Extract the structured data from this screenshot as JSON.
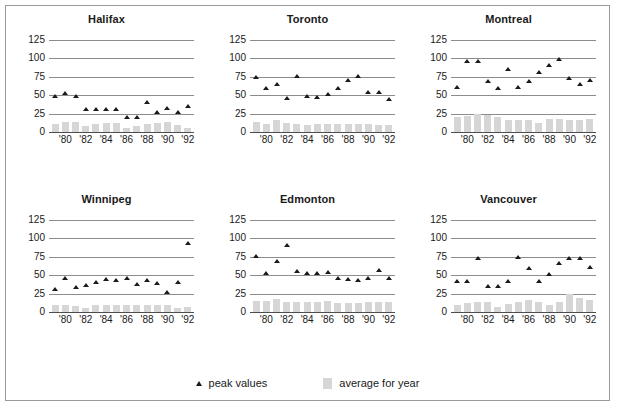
{
  "figure": {
    "border_color": "#9a9a9a",
    "background": "#ffffff"
  },
  "legend": {
    "peak_label": "peak values",
    "average_label": "average for year"
  },
  "axis": {
    "yticks": [
      0,
      25,
      50,
      75,
      100,
      125
    ],
    "ylim": [
      0,
      125
    ],
    "xtick_labels": [
      "'80",
      "'82",
      "'84",
      "'86",
      "'88",
      "'90",
      "'92"
    ],
    "xtick_years": [
      1980,
      1982,
      1984,
      1986,
      1988,
      1990,
      1992
    ],
    "xlim": [
      1978.4,
      1992.6
    ]
  },
  "colors": {
    "marker": "#1a1a1a",
    "bar": "#d6d6d6",
    "gridline": "#8c8c8c",
    "text": "#1a1a1a"
  },
  "chart_data": [
    {
      "type": "scatter",
      "title": "Halifax",
      "xlabel": "",
      "ylabel": "",
      "ylim": [
        0,
        125
      ],
      "grid": true,
      "legend_position": "bottom",
      "x": [
        1979,
        1980,
        1981,
        1982,
        1983,
        1984,
        1985,
        1986,
        1987,
        1988,
        1989,
        1990,
        1991,
        1992
      ],
      "series": [
        {
          "name": "peak values",
          "type": "scatter",
          "values": [
            48,
            52,
            48,
            31,
            31,
            31,
            31,
            20,
            20,
            40,
            26,
            32,
            27,
            35
          ]
        },
        {
          "name": "average for year",
          "type": "bar",
          "values": [
            11,
            13,
            14,
            8,
            11,
            12,
            12,
            5,
            8,
            11,
            12,
            13,
            10,
            6
          ]
        }
      ]
    },
    {
      "type": "scatter",
      "title": "Toronto",
      "xlabel": "",
      "ylabel": "",
      "ylim": [
        0,
        125
      ],
      "grid": true,
      "legend_position": "bottom",
      "x": [
        1979,
        1980,
        1981,
        1982,
        1983,
        1984,
        1985,
        1986,
        1987,
        1988,
        1989,
        1990,
        1991,
        1992
      ],
      "series": [
        {
          "name": "peak values",
          "type": "scatter",
          "values": [
            74,
            59,
            64,
            46,
            76,
            48,
            47,
            51,
            59,
            70,
            75,
            54,
            54,
            44
          ]
        },
        {
          "name": "average for year",
          "type": "bar",
          "values": [
            13,
            11,
            17,
            12,
            11,
            10,
            11,
            11,
            11,
            11,
            11,
            11,
            9,
            10
          ]
        }
      ]
    },
    {
      "type": "scatter",
      "title": "Montreal",
      "xlabel": "",
      "ylabel": "",
      "ylim": [
        0,
        125
      ],
      "grid": true,
      "legend_position": "bottom",
      "x": [
        1979,
        1980,
        1981,
        1982,
        1983,
        1984,
        1985,
        1986,
        1987,
        1988,
        1989,
        1990,
        1991,
        1992
      ],
      "series": [
        {
          "name": "peak values",
          "type": "scatter",
          "values": [
            60,
            96,
            96,
            68,
            59,
            85,
            61,
            69,
            81,
            91,
            98,
            73,
            64,
            70
          ]
        },
        {
          "name": "average for year",
          "type": "bar",
          "values": [
            21,
            22,
            25,
            23,
            20,
            17,
            17,
            17,
            12,
            18,
            18,
            17,
            17,
            18
          ]
        }
      ]
    },
    {
      "type": "scatter",
      "title": "Winnipeg",
      "xlabel": "",
      "ylabel": "",
      "ylim": [
        0,
        125
      ],
      "grid": true,
      "legend_position": "bottom",
      "x": [
        1979,
        1980,
        1981,
        1982,
        1983,
        1984,
        1985,
        1986,
        1987,
        1988,
        1989,
        1990,
        1991,
        1992
      ],
      "series": [
        {
          "name": "peak values",
          "type": "scatter",
          "values": [
            31,
            45,
            33,
            36,
            40,
            44,
            43,
            45,
            38,
            43,
            39,
            27,
            40,
            93
          ]
        },
        {
          "name": "average for year",
          "type": "bar",
          "values": [
            9,
            9,
            8,
            6,
            9,
            9,
            9,
            9,
            9,
            9,
            9,
            9,
            6,
            7
          ]
        }
      ]
    },
    {
      "type": "scatter",
      "title": "Edmonton",
      "xlabel": "",
      "ylabel": "",
      "ylim": [
        0,
        125
      ],
      "grid": true,
      "legend_position": "bottom",
      "x": [
        1979,
        1980,
        1981,
        1982,
        1983,
        1984,
        1985,
        1986,
        1987,
        1988,
        1989,
        1990,
        1991,
        1992
      ],
      "series": [
        {
          "name": "peak values",
          "type": "scatter",
          "values": [
            76,
            52,
            68,
            90,
            55,
            52,
            52,
            53,
            45,
            44,
            43,
            46,
            56,
            46
          ]
        },
        {
          "name": "average for year",
          "type": "bar",
          "values": [
            15,
            15,
            18,
            14,
            14,
            14,
            14,
            15,
            12,
            12,
            12,
            13,
            14,
            14
          ]
        }
      ]
    },
    {
      "type": "scatter",
      "title": "Vancouver",
      "xlabel": "",
      "ylabel": "",
      "ylim": [
        0,
        125
      ],
      "grid": true,
      "legend_position": "bottom",
      "x": [
        1979,
        1980,
        1981,
        1982,
        1983,
        1984,
        1985,
        1986,
        1987,
        1988,
        1989,
        1990,
        1991,
        1992
      ],
      "series": [
        {
          "name": "peak values",
          "type": "scatter",
          "values": [
            41,
            41,
            73,
            34,
            34,
            41,
            74,
            59,
            41,
            51,
            66,
            73,
            73,
            60
          ]
        },
        {
          "name": "average for year",
          "type": "bar",
          "values": [
            9,
            12,
            13,
            14,
            7,
            11,
            14,
            16,
            13,
            10,
            13,
            25,
            19,
            16
          ]
        }
      ]
    }
  ]
}
